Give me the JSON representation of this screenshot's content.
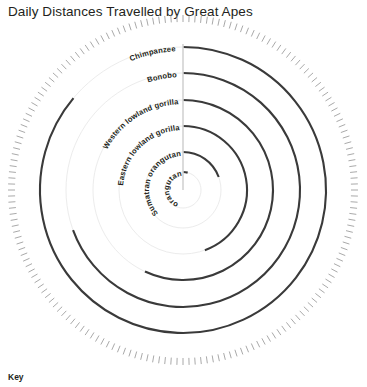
{
  "title": "Daily Distances Travelled by Great Apes",
  "key": {
    "label": "Key"
  },
  "geometry": {
    "cx": 183,
    "cy": 190,
    "outer_ring_radius": 175,
    "tick_count": 180,
    "tick_length": 7,
    "axis_top_y": 44
  },
  "chart_data": {
    "type": "line",
    "subtype": "spiral-radial-arc",
    "title": "Daily Distances Travelled by Great Apes",
    "xlabel": "",
    "ylabel": "",
    "legend": "Key",
    "grid": true,
    "legend_position": "bottom-left",
    "note": "Each species is drawn as an arc beginning at the 12 o'clock axis and sweeping clockwise; arc sweep encodes daily distance travelled. Outer arcs = larger radius.",
    "categories": [
      "Chimpanzee",
      "Bonobo",
      "Western lowland gorilla",
      "Eastern lowland gorilla",
      "Sumatran orangutan",
      "Bornean orangutan"
    ],
    "series": [
      {
        "name": "Daily distance travelled",
        "values": [
          310,
          250,
          205,
          160,
          70,
          15
        ]
      }
    ],
    "points": [
      {
        "label": "Chimpanzee",
        "radius": 143,
        "sweep_deg": 310,
        "color": "#3a3a3a"
      },
      {
        "label": "Bonobo",
        "radius": 117,
        "sweep_deg": 250,
        "color": "#3a3a3a"
      },
      {
        "label": "Western lowland gorilla",
        "radius": 90,
        "sweep_deg": 205,
        "color": "#3a3a3a"
      },
      {
        "label": "Eastern lowland gorilla",
        "radius": 64,
        "sweep_deg": 160,
        "color": "#3a3a3a"
      },
      {
        "label": "Sumatran orangutan",
        "radius": 38,
        "sweep_deg": 70,
        "color": "#3a3a3a"
      },
      {
        "label": "Bornean orangutan",
        "radius": 18,
        "sweep_deg": 15,
        "color": "#3a3a3a"
      }
    ]
  },
  "colors": {
    "arc": "#3a3a3a",
    "guide": "#ececec",
    "tick": "#8c8c8c",
    "axis": "#d2d2d2",
    "text": "#231f20",
    "background": "#ffffff"
  }
}
